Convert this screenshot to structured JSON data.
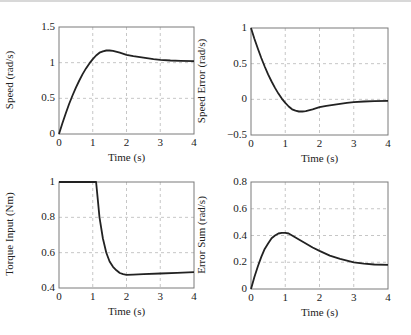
{
  "chart_data": [
    {
      "type": "line",
      "title": "",
      "xlabel": "Time (s)",
      "ylabel": "Speed (rad/s)",
      "xlim": [
        0,
        4
      ],
      "ylim": [
        0,
        1.5
      ],
      "xticks": [
        0,
        1,
        2,
        3,
        4
      ],
      "xtick_labels": [
        "0",
        "1",
        "2",
        "3",
        "4"
      ],
      "yticks": [
        0,
        0.5,
        1,
        1.5
      ],
      "ytick_labels": [
        "0",
        "0.5",
        "1",
        "1.5"
      ],
      "grid": true,
      "series": [
        {
          "name": "Speed",
          "x": [
            0,
            0.1,
            0.2,
            0.3,
            0.4,
            0.5,
            0.6,
            0.7,
            0.8,
            0.9,
            1.0,
            1.1,
            1.2,
            1.3,
            1.4,
            1.5,
            1.6,
            1.8,
            2.0,
            2.2,
            2.5,
            2.8,
            3.0,
            3.3,
            3.6,
            4.0
          ],
          "y": [
            0,
            0.15,
            0.29,
            0.42,
            0.54,
            0.65,
            0.75,
            0.84,
            0.92,
            0.99,
            1.05,
            1.1,
            1.14,
            1.16,
            1.17,
            1.17,
            1.165,
            1.14,
            1.11,
            1.09,
            1.07,
            1.05,
            1.04,
            1.03,
            1.025,
            1.02
          ]
        }
      ]
    },
    {
      "type": "line",
      "title": "",
      "xlabel": "Time (s)",
      "ylabel": "Speed Error (rad/s)",
      "xlim": [
        0,
        4
      ],
      "ylim": [
        -0.5,
        1
      ],
      "xticks": [
        0,
        1,
        2,
        3,
        4
      ],
      "xtick_labels": [
        "0",
        "1",
        "2",
        "3",
        "4"
      ],
      "yticks": [
        -0.5,
        0,
        0.5,
        1
      ],
      "ytick_labels": [
        "−0.5",
        "0",
        "0.5",
        "1"
      ],
      "grid": true,
      "series": [
        {
          "name": "Speed Error",
          "x": [
            0,
            0.1,
            0.2,
            0.3,
            0.4,
            0.5,
            0.6,
            0.7,
            0.8,
            0.9,
            1.0,
            1.1,
            1.2,
            1.3,
            1.4,
            1.5,
            1.6,
            1.8,
            2.0,
            2.2,
            2.5,
            2.8,
            3.0,
            3.3,
            3.6,
            4.0
          ],
          "y": [
            1,
            0.85,
            0.71,
            0.58,
            0.46,
            0.35,
            0.25,
            0.16,
            0.08,
            0.01,
            -0.05,
            -0.1,
            -0.14,
            -0.16,
            -0.17,
            -0.17,
            -0.165,
            -0.14,
            -0.11,
            -0.09,
            -0.07,
            -0.05,
            -0.04,
            -0.03,
            -0.025,
            -0.02
          ]
        }
      ]
    },
    {
      "type": "line",
      "title": "",
      "xlabel": "Time (s)",
      "ylabel": "Torque Input (Nm)",
      "xlim": [
        0,
        4
      ],
      "ylim": [
        0.4,
        1
      ],
      "xticks": [
        0,
        1,
        2,
        3,
        4
      ],
      "xtick_labels": [
        "0",
        "1",
        "2",
        "3",
        "4"
      ],
      "yticks": [
        0.4,
        0.6,
        0.8,
        1
      ],
      "ytick_labels": [
        "0.4",
        "0.6",
        "0.8",
        "1"
      ],
      "grid": true,
      "series": [
        {
          "name": "Torque Input",
          "x": [
            0,
            1.0,
            1.1,
            1.15,
            1.2,
            1.3,
            1.4,
            1.5,
            1.6,
            1.7,
            1.8,
            1.9,
            2.0,
            2.2,
            2.5,
            3.0,
            3.5,
            4.0
          ],
          "y": [
            1,
            1,
            1,
            0.9,
            0.8,
            0.68,
            0.6,
            0.55,
            0.52,
            0.5,
            0.485,
            0.478,
            0.475,
            0.476,
            0.478,
            0.482,
            0.486,
            0.49
          ]
        }
      ]
    },
    {
      "type": "line",
      "title": "",
      "xlabel": "Time (s)",
      "ylabel": "Error Sum (rad/s)",
      "xlim": [
        0,
        4
      ],
      "ylim": [
        0,
        0.8
      ],
      "xticks": [
        0,
        1,
        2,
        3,
        4
      ],
      "xtick_labels": [
        "0",
        "1",
        "2",
        "3",
        "4"
      ],
      "yticks": [
        0,
        0.2,
        0.4,
        0.6,
        0.8
      ],
      "ytick_labels": [
        "0",
        "0.2",
        "0.4",
        "0.6",
        "0.8"
      ],
      "grid": true,
      "series": [
        {
          "name": "Error Sum",
          "x": [
            0,
            0.1,
            0.2,
            0.3,
            0.4,
            0.5,
            0.6,
            0.7,
            0.8,
            0.9,
            1.0,
            1.1,
            1.2,
            1.4,
            1.6,
            1.8,
            2.0,
            2.3,
            2.6,
            3.0,
            3.3,
            3.6,
            4.0
          ],
          "y": [
            0,
            0.09,
            0.17,
            0.24,
            0.3,
            0.34,
            0.38,
            0.4,
            0.415,
            0.42,
            0.42,
            0.415,
            0.4,
            0.37,
            0.34,
            0.31,
            0.285,
            0.25,
            0.225,
            0.2,
            0.19,
            0.183,
            0.18
          ]
        }
      ]
    }
  ],
  "panels": [
    {
      "ylabel": "Speed (rad/s)",
      "xlabel": "Time (s)"
    },
    {
      "ylabel": "Speed Error (rad/s)",
      "xlabel": "Time (s)"
    },
    {
      "ylabel": "Torque Input (Nm)",
      "xlabel": "Time (s)"
    },
    {
      "ylabel": "Error Sum (rad/s)",
      "xlabel": "Time (s)"
    }
  ],
  "colors": {
    "line": "#222222",
    "grid": "#b8b8b8",
    "axes": "#7a7a7a",
    "background": "#ffffff"
  }
}
